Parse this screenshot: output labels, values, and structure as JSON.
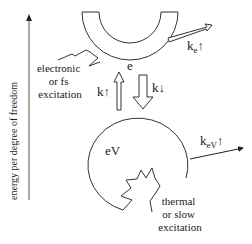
{
  "diagram": {
    "axis_label": "energy per degree of freedom",
    "electron_bath": {
      "label": "e"
    },
    "vibration_bath": {
      "label": "eV"
    },
    "transfer_up": {
      "label": "k↑"
    },
    "transfer_down": {
      "label": "k↓"
    },
    "electron_loss": {
      "label_main": "k",
      "label_sub": "e",
      "label_arrow": "↑"
    },
    "vibration_loss": {
      "label_main": "k",
      "label_sub": "eV",
      "label_arrow": "↑"
    },
    "electronic_excitation": {
      "lines": [
        "electronic",
        "or fs",
        "excitation"
      ]
    },
    "thermal_excitation": {
      "lines": [
        "thermal",
        "or slow",
        "excitation"
      ]
    },
    "colors": {
      "stroke": "#333333",
      "text": "#222222",
      "background": "#ffffff"
    }
  }
}
